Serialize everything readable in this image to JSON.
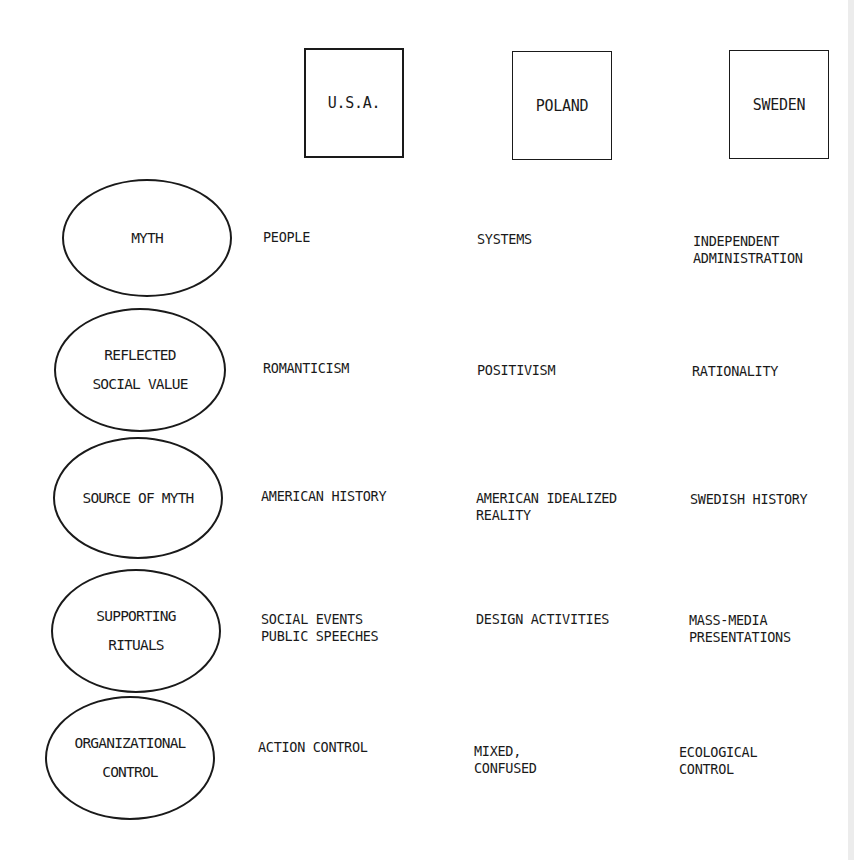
{
  "columns": [
    {
      "label": "U.S.A."
    },
    {
      "label": "POLAND"
    },
    {
      "label": "SWEDEN"
    }
  ],
  "rows": [
    {
      "label": "MYTH",
      "cells": [
        "PEOPLE",
        "SYSTEMS",
        "INDEPENDENT\nADMINISTRATION"
      ]
    },
    {
      "label": "REFLECTED\nSOCIAL VALUE",
      "cells": [
        "ROMANTICISM",
        "POSITIVISM",
        "RATIONALITY"
      ]
    },
    {
      "label": "SOURCE OF MYTH",
      "cells": [
        "AMERICAN HISTORY",
        "AMERICAN IDEALIZED\nREALITY",
        "SWEDISH HISTORY"
      ]
    },
    {
      "label": "SUPPORTING\nRITUALS",
      "cells": [
        "SOCIAL EVENTS\nPUBLIC SPEECHES",
        "DESIGN ACTIVITIES",
        "MASS-MEDIA\nPRESENTATIONS"
      ]
    },
    {
      "label": "ORGANIZATIONAL\nCONTROL",
      "cells": [
        "ACTION CONTROL",
        "MIXED,\nCONFUSED",
        "ECOLOGICAL\nCONTROL"
      ]
    }
  ]
}
